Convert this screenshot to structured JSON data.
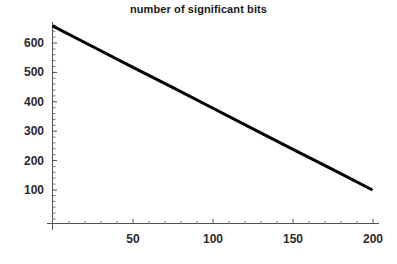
{
  "chart_data": {
    "type": "line",
    "title": "number of significant bits",
    "xlabel": "",
    "ylabel": "",
    "xlim": [
      0,
      205
    ],
    "ylim": [
      0,
      680
    ],
    "grid": false,
    "legend": null,
    "x_ticks": [
      50,
      100,
      150,
      200
    ],
    "x_tick_labels": [
      "50",
      "100",
      "150",
      "200"
    ],
    "y_ticks": [
      100,
      200,
      300,
      400,
      500,
      600
    ],
    "y_tick_labels": [
      "100",
      "200",
      "300",
      "400",
      "500",
      "600"
    ],
    "x_minor_tick_step": 10,
    "y_minor_tick_step": 20,
    "line_color": "#000000",
    "line_width": 3,
    "axis_color": "#555555",
    "background_color": "#ffffff",
    "series": [
      {
        "name": "significant bits",
        "x": [
          0,
          25,
          50,
          75,
          100,
          125,
          150,
          175,
          200
        ],
        "values": [
          658,
          588,
          518,
          449,
          379,
          309,
          239,
          170,
          100
        ]
      }
    ]
  },
  "axis": {
    "x_label_50": "50",
    "x_label_100": "100",
    "x_label_150": "150",
    "x_label_200": "200",
    "y_label_100": "100",
    "y_label_200": "200",
    "y_label_300": "300",
    "y_label_400": "400",
    "y_label_500": "500",
    "y_label_600": "600"
  }
}
